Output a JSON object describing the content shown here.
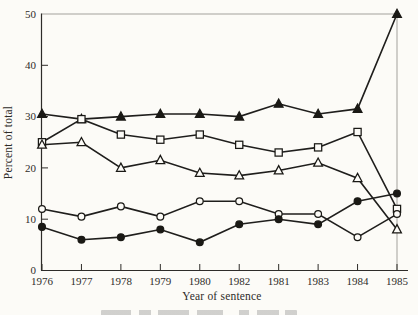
{
  "colors": {
    "background": "#fcfbf7",
    "data_line": "#1f1e1c",
    "marker_stroke": "#1a1915",
    "marker_open_fill": "#fcfbf7",
    "axis_dark": "#2e2c29",
    "frame_light": "#a3a19c",
    "text": "#2e2c29"
  },
  "chart_data": {
    "type": "line",
    "title": "",
    "xlabel": "Year of sentence",
    "ylabel": "Percent of total",
    "x_categories": [
      "1976",
      "1977",
      "1978",
      "1979",
      "1980",
      "1982",
      "1981",
      "1983",
      "1984",
      "1985"
    ],
    "ylim": [
      0,
      50
    ],
    "yticks": [
      0,
      10,
      20,
      30,
      40,
      50
    ],
    "grid": false,
    "legend": "none",
    "series": [
      {
        "name": "filled-triangle-series",
        "marker": "triangle",
        "fill": "filled",
        "values": [
          30.5,
          29.5,
          30,
          30.5,
          30.5,
          30,
          32.5,
          30.5,
          31.5,
          50
        ]
      },
      {
        "name": "open-square-series",
        "marker": "square",
        "fill": "open",
        "values": [
          25,
          29.5,
          26.5,
          25.5,
          26.5,
          24.5,
          23,
          24,
          27,
          12
        ]
      },
      {
        "name": "open-triangle-series",
        "marker": "triangle",
        "fill": "open",
        "values": [
          24.5,
          25,
          20,
          21.5,
          19,
          18.5,
          19.5,
          21,
          18,
          8
        ]
      },
      {
        "name": "open-circle-series",
        "marker": "circle",
        "fill": "open",
        "values": [
          12,
          10.5,
          12.5,
          10.5,
          13.5,
          13.5,
          11,
          11,
          6.5,
          11
        ]
      },
      {
        "name": "filled-circle-series",
        "marker": "circle",
        "fill": "filled",
        "values": [
          8.5,
          6,
          6.5,
          8,
          5.5,
          9,
          10,
          9,
          13.5,
          15
        ]
      }
    ]
  }
}
